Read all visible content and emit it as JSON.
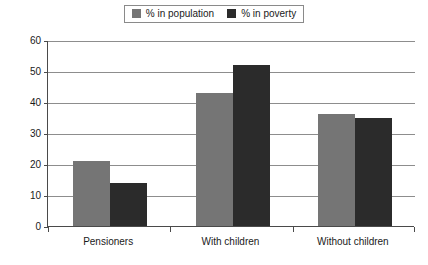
{
  "chart_data": {
    "type": "bar",
    "title": "",
    "xlabel": "",
    "ylabel": "",
    "categories": [
      "Pensioners",
      "With children",
      "Without children"
    ],
    "series": [
      {
        "name": "% in population",
        "color": "#757575",
        "values": [
          21,
          43,
          36
        ]
      },
      {
        "name": "% in poverty",
        "color": "#2b2b2b",
        "values": [
          14,
          52,
          35
        ]
      }
    ],
    "ylim": [
      0,
      60
    ],
    "ytick_step": 10,
    "yticks": [
      0,
      10,
      20,
      30,
      40,
      50,
      60
    ],
    "ytick_labels": [
      "0",
      "10",
      "20",
      "30",
      "40",
      "50",
      "60"
    ],
    "grid": true,
    "legend_position": "top-center"
  }
}
